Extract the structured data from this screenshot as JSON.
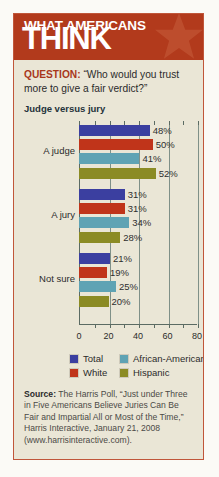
{
  "header": {
    "line1": "WHAT AMERICANS",
    "line2": "THINK",
    "star_icon": "star-icon",
    "bg_color": "#b23a1c"
  },
  "question": {
    "label": "QUESTION:",
    "text": " “Who would you trust more to give a fair verdict?”"
  },
  "chart_data": {
    "type": "bar",
    "orientation": "horizontal",
    "title": "Judge versus jury",
    "xlabel": "",
    "ylabel": "",
    "xlim": [
      0,
      80
    ],
    "xticks": [
      0,
      20,
      40,
      60,
      80
    ],
    "xtick_labels": [
      "0",
      "20",
      "40",
      "60",
      "80"
    ],
    "minor_tick_step": 10,
    "grid": true,
    "legend_position": "bottom",
    "categories": [
      "A judge",
      "A jury",
      "Not sure"
    ],
    "series": [
      {
        "name": "Total",
        "color": "#3b3fa0",
        "values": [
          48,
          31,
          21
        ],
        "value_labels": [
          "48%",
          "31%",
          "21%"
        ]
      },
      {
        "name": "White",
        "color": "#c0341a",
        "values": [
          50,
          31,
          19
        ],
        "value_labels": [
          "50%",
          "31%",
          "19%"
        ]
      },
      {
        "name": "African-American",
        "color": "#5fa3b4",
        "values": [
          41,
          34,
          25
        ],
        "value_labels": [
          "41%",
          "34%",
          "25%"
        ]
      },
      {
        "name": "Hispanic",
        "color": "#8b8b24",
        "values": [
          52,
          28,
          20
        ],
        "value_labels": [
          "52%",
          "28%",
          "20%"
        ]
      }
    ]
  },
  "legend": [
    {
      "label": "Total",
      "color": "#3b3fa0"
    },
    {
      "label": "African-American",
      "color": "#5fa3b4"
    },
    {
      "label": "White",
      "color": "#c0341a"
    },
    {
      "label": "Hispanic",
      "color": "#8b8b24"
    }
  ],
  "source": {
    "label": "Source:",
    "text": " The Harris Poll, “Just under Three in Five Americans Believe Juries Can Be Fair and Impartial All or Most of the Time,” Harris Interactive, January 21, 2008 (www.harrisinteractive.com)."
  }
}
